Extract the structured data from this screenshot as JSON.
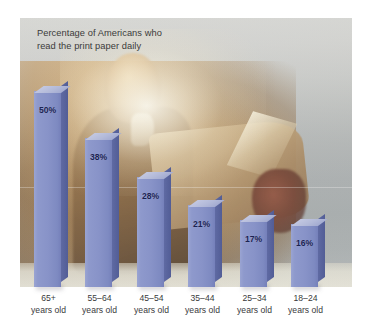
{
  "chart_data": {
    "type": "bar",
    "title": "Percentage of Americans who\nread the print paper daily",
    "title_line1": "Percentage of Americans who",
    "title_line2": "read the print paper daily",
    "xlabel": "",
    "ylabel": "",
    "ylim": [
      0,
      55
    ],
    "grid": false,
    "legend": "none",
    "unit": "%",
    "categories": [
      "65+ years old",
      "55–64 years old",
      "45–54 years old",
      "35–44 years old",
      "25–34 years old",
      "18–24 years old"
    ],
    "values": [
      50,
      38,
      28,
      21,
      17,
      16
    ],
    "value_labels": [
      "50%",
      "38%",
      "28%",
      "21%",
      "17%",
      "16%"
    ],
    "bars": [
      {
        "category_line1": "65+",
        "category_line2": "years old",
        "value": 50,
        "label": "50%"
      },
      {
        "category_line1": "55–64",
        "category_line2": "years old",
        "value": 38,
        "label": "38%"
      },
      {
        "category_line1": "45–54",
        "category_line2": "years old",
        "value": 28,
        "label": "28%"
      },
      {
        "category_line1": "35–44",
        "category_line2": "years old",
        "value": 21,
        "label": "21%"
      },
      {
        "category_line1": "25–34",
        "category_line2": "years old",
        "value": 17,
        "label": "17%"
      },
      {
        "category_line1": "18–24",
        "category_line2": "years old",
        "value": 16,
        "label": "16%"
      }
    ],
    "colors": {
      "bar_front": "#8893c8",
      "bar_side": "#5a6599",
      "bar_top": "#b3bad9",
      "value_text": "#1b2352",
      "title_text": "#3b3b3b",
      "category_text": "#39393b",
      "background": "#ffffff"
    }
  },
  "figure": {
    "background_image_alt": "man-reading-newspaper-photo"
  }
}
